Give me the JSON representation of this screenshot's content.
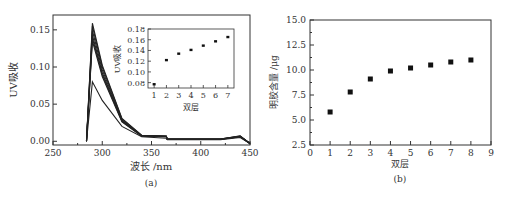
{
  "chart_data": [
    {
      "type": "line",
      "panel_label": "(a)",
      "xlabel": "波长 /nm",
      "ylabel": "UV吸收",
      "xlim": [
        250,
        450
      ],
      "ylim": [
        -0.005,
        0.17
      ],
      "xticks": [
        250,
        300,
        350,
        400,
        450
      ],
      "yticks": [
        0.0,
        0.05,
        0.1,
        0.15
      ],
      "ytick_labels": [
        "0.00",
        "0.05",
        "0.10",
        "0.15"
      ],
      "series_note": "7 overlapping absorption spectra, peak near 290 nm",
      "series": [
        {
          "name": "1 bilayer",
          "x": [
            284,
            290,
            300,
            320,
            340,
            365,
            366,
            420,
            440,
            450
          ],
          "y": [
            0.0,
            0.08,
            0.055,
            0.02,
            0.006,
            0.004,
            0.002,
            0.002,
            0.005,
            -0.003
          ]
        },
        {
          "name": "2-7 bilayers",
          "x": [
            284,
            290,
            300,
            320,
            340,
            365,
            366,
            420,
            440,
            450
          ],
          "y": [
            0.0,
            0.155,
            0.1,
            0.03,
            0.008,
            0.007,
            0.003,
            0.003,
            0.007,
            -0.003
          ]
        }
      ],
      "inset": {
        "type": "scatter",
        "xlabel": "双层",
        "ylabel": "UV吸收",
        "xlim": [
          0.5,
          7.5
        ],
        "ylim": [
          0.07,
          0.18
        ],
        "xticks": [
          1,
          2,
          3,
          4,
          5,
          6,
          7
        ],
        "yticks": [
          0.08,
          0.1,
          0.12,
          0.14,
          0.16,
          0.18
        ],
        "ytick_labels": [
          "0.08",
          "0.10",
          "0.12",
          "0.14",
          "0.16",
          "0.18"
        ],
        "x": [
          1,
          2,
          3,
          4,
          5,
          6,
          7
        ],
        "y": [
          0.077,
          0.122,
          0.134,
          0.141,
          0.149,
          0.157,
          0.165
        ]
      }
    },
    {
      "type": "scatter",
      "panel_label": "(b)",
      "xlabel": "双层",
      "ylabel": "明胶含量 /μg",
      "xlim": [
        0,
        9
      ],
      "ylim": [
        2.5,
        15.0
      ],
      "xticks": [
        0,
        1,
        2,
        3,
        4,
        5,
        6,
        7,
        8,
        9
      ],
      "yticks": [
        2.5,
        5.0,
        7.5,
        10.0,
        12.5,
        15.0
      ],
      "ytick_labels": [
        "2.5",
        "5.0",
        "7.5",
        "10.0",
        "12.5",
        "15.0"
      ],
      "x": [
        1,
        2,
        3,
        4,
        5,
        6,
        7,
        8
      ],
      "y": [
        5.8,
        7.8,
        9.1,
        9.9,
        10.2,
        10.5,
        10.8,
        11.0
      ]
    }
  ]
}
